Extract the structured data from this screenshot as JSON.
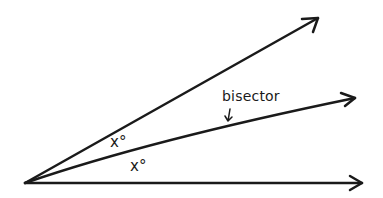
{
  "diagram": {
    "type": "angle-bisector",
    "vertex": [
      25,
      183
    ],
    "rays": [
      {
        "name": "upper-ray",
        "end": [
          318,
          18
        ]
      },
      {
        "name": "bisector-ray",
        "end": [
          355,
          98
        ]
      },
      {
        "name": "lower-ray",
        "end": [
          362,
          183
        ]
      }
    ],
    "labels": {
      "bisector": "bisector",
      "upper_angle": "x°",
      "lower_angle": "x°"
    },
    "colors": {
      "stroke": "#1a1a1a",
      "background": "#ffffff"
    }
  }
}
